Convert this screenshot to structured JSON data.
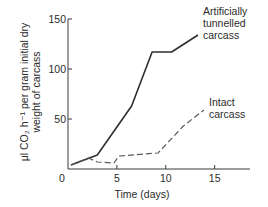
{
  "chart_data": {
    "type": "line",
    "title": "",
    "xlabel": "Time (days)",
    "ylabel_lines": [
      "μl CO₂ h⁻¹ per gram initial dry",
      "weight of carcass"
    ],
    "xlim": [
      0,
      18
    ],
    "ylim": [
      0,
      150
    ],
    "xticks": [
      0,
      5,
      10,
      15
    ],
    "xtick_labels": [
      "0",
      "5",
      "10",
      "15"
    ],
    "yticks": [
      0,
      50,
      100,
      150
    ],
    "ytick_labels": [
      "0",
      "50",
      "100",
      "150"
    ],
    "grid": false,
    "legend": "none (direct line annotations at right)",
    "series": [
      {
        "name": "Artificially tunnelled carcass",
        "annotation_lines": [
          "Artificially",
          "tunnelled",
          "carcass"
        ],
        "style": "solid",
        "color": "#2e2e2e",
        "x": [
          0.3,
          3.0,
          6.5,
          8.6,
          10.6,
          13.3
        ],
        "y": [
          4,
          14,
          63,
          117,
          117,
          134
        ]
      },
      {
        "name": "Intact carcass",
        "annotation_lines": [
          "Intact",
          "carcass"
        ],
        "style": "dashed",
        "color": "#5a5a5a",
        "x": [
          0.3,
          2.1,
          3.0,
          4.7,
          5.2,
          9.2,
          11.8,
          13.9
        ],
        "y": [
          4,
          11,
          7,
          6,
          13,
          16,
          43,
          59
        ]
      }
    ]
  }
}
